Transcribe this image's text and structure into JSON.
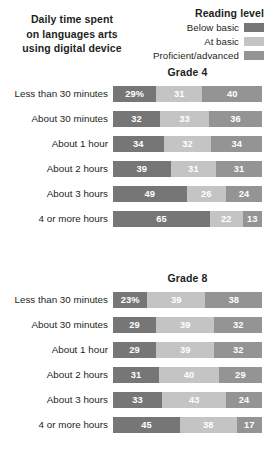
{
  "title": "Daily time spent on languages arts using digital device",
  "title_lines": [
    "Daily time spent",
    "on languages arts",
    "using digital device"
  ],
  "legend": {
    "title": "Reading level",
    "items": [
      {
        "label": "Below basic",
        "color": "#767676",
        "swatch_icon": "legend-swatch-below-basic"
      },
      {
        "label": "At basic",
        "color": "#c4c4c4",
        "swatch_icon": "legend-swatch-at-basic"
      },
      {
        "label": "Proficient/advanced",
        "color": "#949494",
        "swatch_icon": "legend-swatch-proficient-advanced"
      }
    ]
  },
  "chart_data": {
    "type": "bar",
    "subtype": "stacked-horizontal-100pct",
    "title": "Daily time spent on languages arts using digital device",
    "xlabel": "",
    "ylabel": "",
    "xlim": [
      0,
      100
    ],
    "grid": false,
    "legend_position": "top-right",
    "series": [
      {
        "name": "Below basic",
        "color": "#767676"
      },
      {
        "name": "At basic",
        "color": "#c4c4c4"
      },
      {
        "name": "Proficient/advanced",
        "color": "#949494"
      }
    ],
    "groups": [
      {
        "name": "Grade 4",
        "categories": [
          "Less than 30 minutes",
          "About 30 minutes",
          "About 1 hour",
          "About 2 hours",
          "About 3 hours",
          "4 or more hours"
        ],
        "values": [
          [
            29,
            31,
            40
          ],
          [
            32,
            33,
            36
          ],
          [
            34,
            32,
            34
          ],
          [
            39,
            31,
            31
          ],
          [
            49,
            26,
            24
          ],
          [
            65,
            22,
            13
          ]
        ],
        "labels": [
          [
            "29%",
            "31",
            "40"
          ],
          [
            "32",
            "33",
            "36"
          ],
          [
            "34",
            "32",
            "34"
          ],
          [
            "39",
            "31",
            "31"
          ],
          [
            "49",
            "26",
            "24"
          ],
          [
            "65",
            "22",
            "13"
          ]
        ]
      },
      {
        "name": "Grade 8",
        "categories": [
          "Less than 30 minutes",
          "About 30 minutes",
          "About 1 hour",
          "About 2 hours",
          "About 3 hours",
          "4 or more hours"
        ],
        "values": [
          [
            23,
            39,
            38
          ],
          [
            29,
            39,
            32
          ],
          [
            29,
            39,
            32
          ],
          [
            31,
            40,
            29
          ],
          [
            33,
            43,
            24
          ],
          [
            45,
            38,
            17
          ]
        ],
        "labels": [
          [
            "23%",
            "39",
            "38"
          ],
          [
            "29",
            "39",
            "32"
          ],
          [
            "29",
            "39",
            "32"
          ],
          [
            "31",
            "40",
            "29"
          ],
          [
            "33",
            "43",
            "24"
          ],
          [
            "45",
            "38",
            "17"
          ]
        ]
      }
    ]
  }
}
